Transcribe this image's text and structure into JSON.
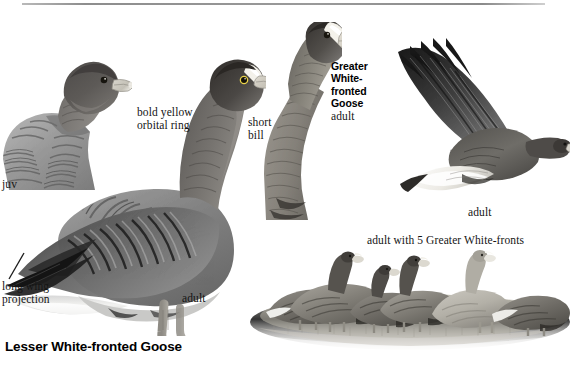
{
  "plate": {
    "title": "Lesser White-fronted Goose",
    "rule": {
      "color": "#8d8d8d"
    }
  },
  "labels": {
    "juv": "juv",
    "bold_yellow_orbital_ring_line1": "bold yellow",
    "bold_yellow_orbital_ring_line2": "orbital ring",
    "short_line1": "short",
    "short_line2": "bill",
    "long_wing_line1": "long wing",
    "long_wing_line2": "projection",
    "adult_standing": "adult",
    "adult_flying": "adult",
    "adult_flock": "adult with 5 Greater White-fronts"
  },
  "greater_block": {
    "line1": "Greater",
    "line2": "White-",
    "line3": "fronted",
    "line4": "Goose",
    "age": "adult"
  },
  "figures": [
    {
      "name": "juvenile-lesser-white-fronted-goose",
      "age": "juv"
    },
    {
      "name": "adult-lesser-white-fronted-goose-standing",
      "age": "adult"
    },
    {
      "name": "greater-white-fronted-goose-head",
      "age": "adult"
    },
    {
      "name": "adult-lesser-white-fronted-goose-flying",
      "age": "adult"
    },
    {
      "name": "flock-lesser-with-greater-white-fronts",
      "age": "adult with 5 Greater White-fronts"
    }
  ],
  "colors": {
    "ink": "#141414",
    "rule": "#8d8d8d",
    "plumage_dark": "#4a4a4a",
    "plumage_mid": "#8a8a8a",
    "plumage_light": "#c8c8c8",
    "bill": "#d8d5cc",
    "ground": "#b5b2a6"
  }
}
